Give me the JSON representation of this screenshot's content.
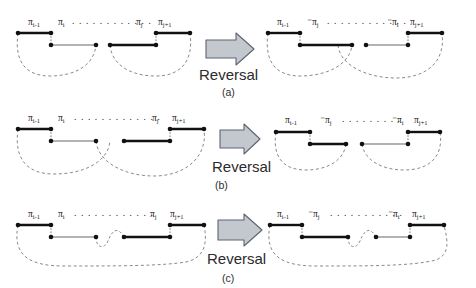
{
  "figure": {
    "background": "#ffffff",
    "ink": "#1a1a1a",
    "thin_edge_color": "#8c8c8c",
    "dashed_color": "#8a8a8a",
    "arrow_fill": "#c3c8cf",
    "arrow_stroke": "#5d6470",
    "rows": [
      {
        "id": "a",
        "caption": "(a)",
        "arrow_label": "Reversal",
        "left": {
          "labels": [
            "π",
            "π",
            "π",
            "π"
          ],
          "label_texts": [
            "πi-1",
            "πi",
            "πj",
            "πj+1"
          ],
          "ellipsis": "· · · · · · · · · ·"
        },
        "right": {
          "label_texts": [
            "πi-1",
            "-πj",
            "-πi",
            "πj+1"
          ],
          "ellipsis": "· · · · · · · · · ·"
        }
      },
      {
        "id": "b",
        "caption": "(b)",
        "arrow_label": "Reversal",
        "left": {
          "label_texts": [
            "πi-1",
            "πi",
            "πj",
            "πj+1"
          ],
          "ellipsis": "· · · · · · · · · ·"
        },
        "right": {
          "label_texts": [
            "πi-1",
            "-πj",
            "-πi",
            "πj+1"
          ],
          "ellipsis": "· · · · · · ·"
        }
      },
      {
        "id": "c",
        "caption": "(c)",
        "arrow_label": "Reversal",
        "left": {
          "label_texts": [
            "πi-1",
            "πi",
            "πj",
            "πj+1"
          ],
          "ellipsis": "· · · · · · · · · ·"
        },
        "right": {
          "label_texts": [
            "πi-1",
            "-πj",
            "-πi",
            "πj+1"
          ],
          "ellipsis": "· · · · · · · · ·"
        }
      }
    ],
    "labels_pi_base": "π",
    "sub_i_minus_1": "i-1",
    "sub_i": "i",
    "sub_j": "j",
    "sub_j_plus_1": "j+1",
    "minus": "-"
  }
}
